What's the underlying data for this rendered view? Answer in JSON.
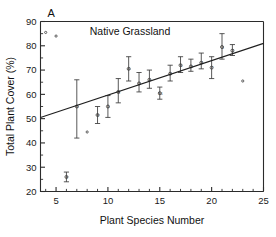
{
  "figure": {
    "panel_label": "A",
    "title": "Native Grassland",
    "xlabel": "Plant Species Number",
    "ylabel": "Total Plant Cover (%)"
  },
  "chart_data": {
    "type": "scatter",
    "title": "Native Grassland",
    "panel": "A",
    "xlabel": "Plant Species Number",
    "ylabel": "Total Plant Cover (%)",
    "xlim": [
      3.5,
      25
    ],
    "ylim": [
      20,
      90
    ],
    "x_major_ticks": [
      5,
      10,
      15,
      20,
      25
    ],
    "x_major_tick_labels": [
      "5",
      "10",
      "15",
      "20",
      "25"
    ],
    "x_minor_tick_step": 1,
    "y_major_ticks": [
      20,
      30,
      40,
      50,
      60,
      70,
      80,
      90
    ],
    "y_major_tick_labels": [
      "20",
      "30",
      "40",
      "50",
      "60",
      "70",
      "80",
      "90"
    ],
    "y_minor_tick_step": 5,
    "grid": false,
    "legend": "none",
    "marker": "open-circle-with-error-bars",
    "error_bar_type": "standard-error",
    "series": [
      {
        "name": "Total plant cover vs species richness",
        "points": [
          {
            "x": 4,
            "y": 85.5,
            "err_lo": 0.0,
            "err_hi": 0.0,
            "n": "1"
          },
          {
            "x": 5,
            "y": 84.0,
            "err_lo": 0.0,
            "err_hi": 0.0,
            "n": "1"
          },
          {
            "x": 6,
            "y": 26.0,
            "err_lo": 2.0,
            "err_hi": 2.0,
            "n": "2"
          },
          {
            "x": 7,
            "y": 55.0,
            "err_lo": 13.0,
            "err_hi": 11.0,
            "n": "5"
          },
          {
            "x": 8,
            "y": 44.5,
            "err_lo": 0.0,
            "err_hi": 0.0,
            "n": "1"
          },
          {
            "x": 9,
            "y": 51.5,
            "err_lo": 3.5,
            "err_hi": 3.5,
            "n": "2"
          },
          {
            "x": 10,
            "y": 55.0,
            "err_lo": 4.5,
            "err_hi": 4.5,
            "n": "5"
          },
          {
            "x": 11,
            "y": 61.0,
            "err_lo": 4.5,
            "err_hi": 5.5,
            "n": "8"
          },
          {
            "x": 12,
            "y": 70.5,
            "err_lo": 5.0,
            "err_hi": 5.0,
            "n": "6"
          },
          {
            "x": 13,
            "y": 64.5,
            "err_lo": 3.5,
            "err_hi": 4.5,
            "n": "6"
          },
          {
            "x": 14,
            "y": 66.0,
            "err_lo": 3.5,
            "err_hi": 4.0,
            "n": "5"
          },
          {
            "x": 15,
            "y": 60.5,
            "err_lo": 2.5,
            "err_hi": 2.5,
            "n": "16"
          },
          {
            "x": 16,
            "y": 68.5,
            "err_lo": 3.0,
            "err_hi": 3.5,
            "n": "6"
          },
          {
            "x": 17,
            "y": 72.0,
            "err_lo": 3.0,
            "err_hi": 3.5,
            "n": "5"
          },
          {
            "x": 18,
            "y": 71.5,
            "err_lo": 2.0,
            "err_hi": 3.0,
            "n": "3"
          },
          {
            "x": 19,
            "y": 73.0,
            "err_lo": 2.5,
            "err_hi": 4.0,
            "n": "4"
          },
          {
            "x": 20,
            "y": 71.0,
            "err_lo": 4.5,
            "err_hi": 4.5,
            "n": "7"
          },
          {
            "x": 21,
            "y": 79.5,
            "err_lo": 5.0,
            "err_hi": 5.5,
            "n": "3"
          },
          {
            "x": 22,
            "y": 78.0,
            "err_lo": 2.0,
            "err_hi": 2.5,
            "n": "2"
          },
          {
            "x": 23,
            "y": 65.5,
            "err_lo": 0.0,
            "err_hi": 0.0,
            "n": "1"
          }
        ]
      }
    ],
    "fit_line": {
      "type": "linear-regression",
      "x_start": 3.5,
      "y_start": 50.5,
      "x_end": 25.0,
      "y_end": 81.0
    }
  }
}
